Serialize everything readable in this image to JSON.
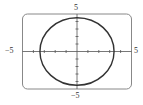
{
  "chart_data": {
    "type": "line",
    "title": "",
    "xlabel": "",
    "ylabel": "",
    "xlim": [
      -5,
      5
    ],
    "ylim": [
      -5,
      5
    ],
    "grid": false,
    "tick_step": 1,
    "tick_labels": {
      "x_min": "−5",
      "x_max": "5",
      "y_min": "−5",
      "y_max": "5"
    },
    "series": [
      {
        "name": "ellipse",
        "shape": "ellipse",
        "center": [
          0,
          0
        ],
        "rx": 3.4,
        "ry": 4.5
      }
    ]
  },
  "colors": {
    "curve": "#333333",
    "axis": "#555555",
    "frame": "#888888"
  }
}
